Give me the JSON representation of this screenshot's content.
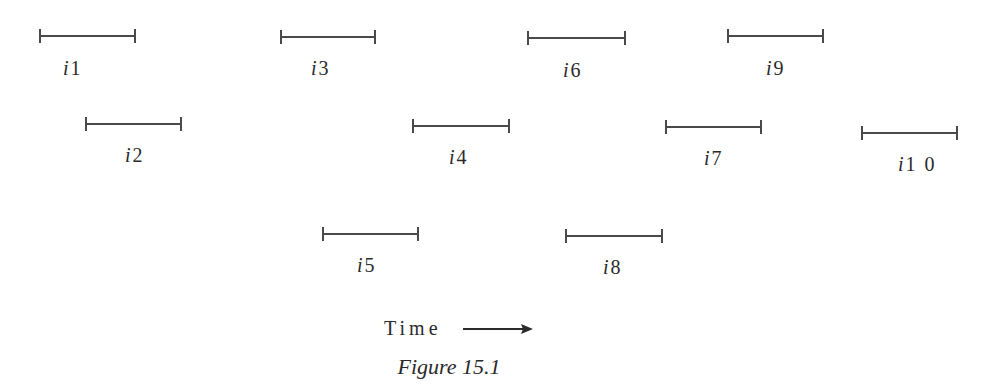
{
  "figure": {
    "caption": "Figure 15.1",
    "axis_label": "Time",
    "axis_arrow": "arrow-right"
  },
  "intervals": [
    {
      "id": "i1",
      "prefix": "i",
      "num": "1",
      "x1": 39,
      "x2": 136,
      "y": 36,
      "label_x": 63,
      "label_y": 58
    },
    {
      "id": "i2",
      "prefix": "i",
      "num": "2",
      "x1": 85,
      "x2": 182,
      "y": 124,
      "label_x": 125,
      "label_y": 145
    },
    {
      "id": "i3",
      "prefix": "i",
      "num": "3",
      "x1": 280,
      "x2": 376,
      "y": 37,
      "label_x": 311,
      "label_y": 58
    },
    {
      "id": "i4",
      "prefix": "i",
      "num": "4",
      "x1": 412,
      "x2": 510,
      "y": 126,
      "label_x": 449,
      "label_y": 147
    },
    {
      "id": "i5",
      "prefix": "i",
      "num": "5",
      "x1": 322,
      "x2": 419,
      "y": 234,
      "label_x": 357,
      "label_y": 255
    },
    {
      "id": "i6",
      "prefix": "i",
      "num": "6",
      "x1": 527,
      "x2": 626,
      "y": 38,
      "label_x": 563,
      "label_y": 60
    },
    {
      "id": "i7",
      "prefix": "i",
      "num": "7",
      "x1": 665,
      "x2": 762,
      "y": 127,
      "label_x": 704,
      "label_y": 148
    },
    {
      "id": "i8",
      "prefix": "i",
      "num": "8",
      "x1": 565,
      "x2": 663,
      "y": 236,
      "label_x": 603,
      "label_y": 257
    },
    {
      "id": "i9",
      "prefix": "i",
      "num": "9",
      "x1": 727,
      "x2": 824,
      "y": 36,
      "label_x": 766,
      "label_y": 58
    },
    {
      "id": "i10",
      "prefix": "i",
      "num": "1 0",
      "x1": 861,
      "x2": 958,
      "y": 133,
      "label_x": 898,
      "label_y": 154
    }
  ],
  "colors": {
    "line": "#4a4a4a",
    "text": "#2a2a2a",
    "background": "#ffffff"
  }
}
